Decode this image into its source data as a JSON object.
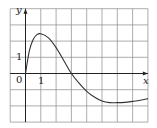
{
  "chart_data": {
    "type": "line",
    "title": "",
    "xlabel": "x",
    "ylabel": "y",
    "tick_labels": {
      "origin": "0",
      "x": [
        "1"
      ],
      "y": [
        "1"
      ]
    },
    "xlim": [
      -1,
      8
    ],
    "ylim": [
      -3,
      4
    ],
    "grid": true,
    "grid_step": 1,
    "series": [
      {
        "name": "curve",
        "x": [
          0,
          0.25,
          0.5,
          0.75,
          1,
          1.5,
          2,
          2.5,
          3,
          3.5,
          4,
          4.5,
          5,
          5.5,
          6,
          6.5,
          7,
          7.5,
          8
        ],
        "y": [
          0,
          1.4,
          2.1,
          2.4,
          2.45,
          2.2,
          1.6,
          0.8,
          0,
          -0.6,
          -1.1,
          -1.45,
          -1.7,
          -1.8,
          -1.8,
          -1.78,
          -1.72,
          -1.65,
          -1.55
        ]
      }
    ]
  },
  "labels": {
    "y_axis": "y",
    "x_axis": "x",
    "origin": "0",
    "x_tick_1": "1",
    "y_tick_1": "1"
  },
  "colors": {
    "grid": "#8a8a8a",
    "axis": "#222222",
    "curve": "#333333"
  }
}
